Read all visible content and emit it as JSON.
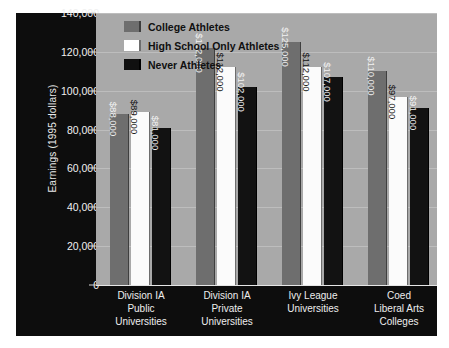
{
  "chart_data": {
    "type": "bar",
    "title": "",
    "xlabel": "",
    "ylabel": "Earnings (1995 dollars)",
    "ylim": [
      0,
      140000
    ],
    "ytick_step": 20000,
    "ytick_labels": [
      "140,000",
      "120,000",
      "100,000",
      "80,000",
      "60,000",
      "40,000",
      "20,000",
      "0"
    ],
    "ytick_values": [
      140000,
      120000,
      100000,
      80000,
      60000,
      40000,
      20000,
      0
    ],
    "grid": true,
    "grid_axis": "y",
    "legend_position": "top-left inside plot",
    "categories": [
      "Division IA\nPublic\nUniversities",
      "Division IA\nPrivate\nUniversities",
      "Ivy League\nUniversities",
      "Coed\nLiberal Arts\nColleges"
    ],
    "category_lines": [
      [
        "Division IA",
        "Public",
        "Universities"
      ],
      [
        "Division IA",
        "Private",
        "Universities"
      ],
      [
        "Ivy League",
        "Universities"
      ],
      [
        "Coed",
        "Liberal Arts",
        "Colleges"
      ]
    ],
    "series": [
      {
        "name": "College Athletes",
        "color": "#6e6e6e",
        "values": [
          88000,
          122000,
          125000,
          110000
        ],
        "labels": [
          "$88,000",
          "$122,000",
          "$125,000",
          "$110,000"
        ]
      },
      {
        "name": "High School Only Athletes",
        "color": "#ffffff",
        "values": [
          89000,
          112000,
          112000,
          97000
        ],
        "labels": [
          "$89,000",
          "$112,000",
          "$112,000",
          "$97,000"
        ]
      },
      {
        "name": "Never Athletes",
        "color": "#101010",
        "values": [
          81000,
          102000,
          107000,
          91000
        ],
        "labels": [
          "$81,000",
          "$102,000",
          "$107,000",
          "$91,000"
        ]
      }
    ]
  },
  "colors": {
    "page_background": "#ffffff",
    "panel_background": "#0d0d0d",
    "plot_background": "#a9a9a9",
    "gridline": "#bdbdbd",
    "axis_text": "#f0f0f0",
    "legend_text": "#101010"
  }
}
